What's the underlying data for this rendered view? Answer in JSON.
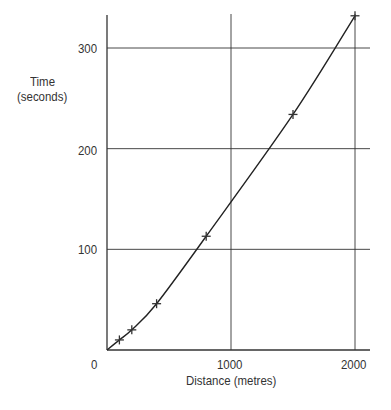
{
  "chart_data": {
    "type": "line",
    "title": "",
    "xlabel": "Distance (metres)",
    "ylabel": "Time (seconds)",
    "ylabel_lines": [
      "Time",
      "(seconds)"
    ],
    "xlim": [
      0,
      2000
    ],
    "ylim": [
      0,
      330
    ],
    "x_ticks": [
      0,
      1000,
      2000
    ],
    "y_ticks": [
      100,
      200,
      300
    ],
    "x_tick_labels": [
      "0",
      "1000",
      "2000"
    ],
    "y_tick_labels": [
      "100",
      "200",
      "300"
    ],
    "grid": true,
    "legend": null,
    "series": [
      {
        "name": "Time vs distance",
        "marker": "+",
        "line": "smooth curve",
        "points": [
          {
            "x": 100,
            "y": 10
          },
          {
            "x": 200,
            "y": 20
          },
          {
            "x": 400,
            "y": 46
          },
          {
            "x": 800,
            "y": 113
          },
          {
            "x": 1500,
            "y": 234
          },
          {
            "x": 2000,
            "y": 332
          }
        ]
      }
    ]
  }
}
